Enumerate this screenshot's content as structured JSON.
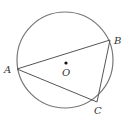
{
  "diagram": {
    "type": "geometry",
    "circle": {
      "cx": 65,
      "cy": 60,
      "r": 48,
      "stroke": "#777777"
    },
    "center": {
      "label": "O",
      "x": 66,
      "y": 63
    },
    "points": [
      {
        "label": "A",
        "x": 17,
        "y": 69
      },
      {
        "label": "B",
        "x": 110,
        "y": 40
      },
      {
        "label": "C",
        "x": 97,
        "y": 102
      }
    ],
    "segments": [
      [
        "A",
        "B"
      ],
      [
        "B",
        "C"
      ],
      [
        "C",
        "A"
      ]
    ],
    "line_color": "#555555"
  }
}
